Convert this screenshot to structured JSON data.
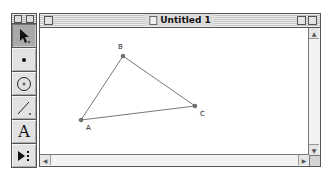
{
  "toolbox": {
    "tools": [
      {
        "name": "selection-arrow-tool",
        "icon": "arrow-icon",
        "active": true
      },
      {
        "name": "point-tool",
        "icon": "point-icon"
      },
      {
        "name": "compass-tool",
        "icon": "circle-icon"
      },
      {
        "name": "straightedge-tool",
        "icon": "segment-icon"
      },
      {
        "name": "text-tool",
        "icon": "text-icon",
        "glyph": "A"
      },
      {
        "name": "custom-tool",
        "icon": "custom-tool-icon"
      }
    ]
  },
  "window": {
    "title": "Untitled 1"
  },
  "sketch": {
    "points": [
      {
        "label": "A",
        "x": 41,
        "y": 92
      },
      {
        "label": "B",
        "x": 83,
        "y": 28
      },
      {
        "label": "C",
        "x": 155,
        "y": 78
      }
    ],
    "segments": [
      [
        "A",
        "B"
      ],
      [
        "B",
        "C"
      ],
      [
        "C",
        "A"
      ]
    ]
  },
  "scrollbars": {
    "up_arrow": "▲",
    "down_arrow": "▼",
    "left_arrow": "◀",
    "right_arrow": "▶"
  }
}
